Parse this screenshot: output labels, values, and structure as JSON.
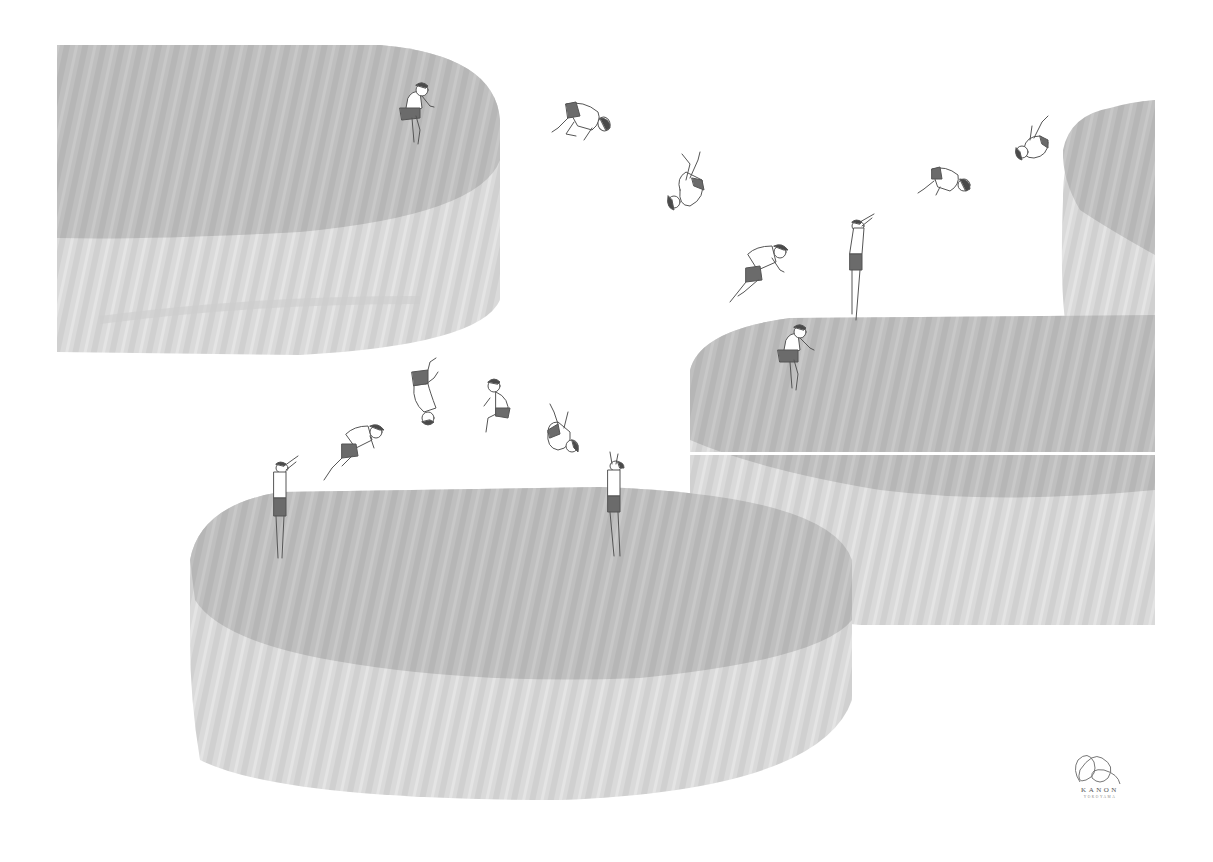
{
  "artwork": {
    "description": "Illustration of boys in swim shorts jumping and somersaulting between large grey wood-grain cylindrical platforms",
    "colors": {
      "background": "#ffffff",
      "platform_top": "#bfbfbf",
      "platform_side": "#d9d9d9",
      "platform_grain": "#cfcfcf",
      "shorts": "#6b6b6b",
      "hair": "#4a4a4a",
      "outline": "#555555"
    },
    "platforms": [
      {
        "name": "top-left-platform"
      },
      {
        "name": "top-right-platform"
      },
      {
        "name": "middle-right-platform"
      },
      {
        "name": "bottom-platform"
      }
    ],
    "figures_count": 17
  },
  "signature": {
    "name": "KANON",
    "subtitle": "YOKOYAMA"
  }
}
